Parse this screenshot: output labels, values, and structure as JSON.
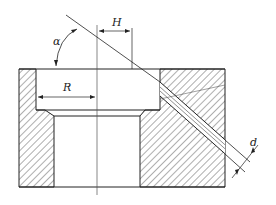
{
  "diagram": {
    "type": "engineering cross-section",
    "labels": {
      "angle": "α",
      "horizontal_offset": "H",
      "radius": "R",
      "diameter": "d"
    },
    "colors": {
      "line": "#222222",
      "hatch": "#333333",
      "background": "#ffffff"
    }
  }
}
